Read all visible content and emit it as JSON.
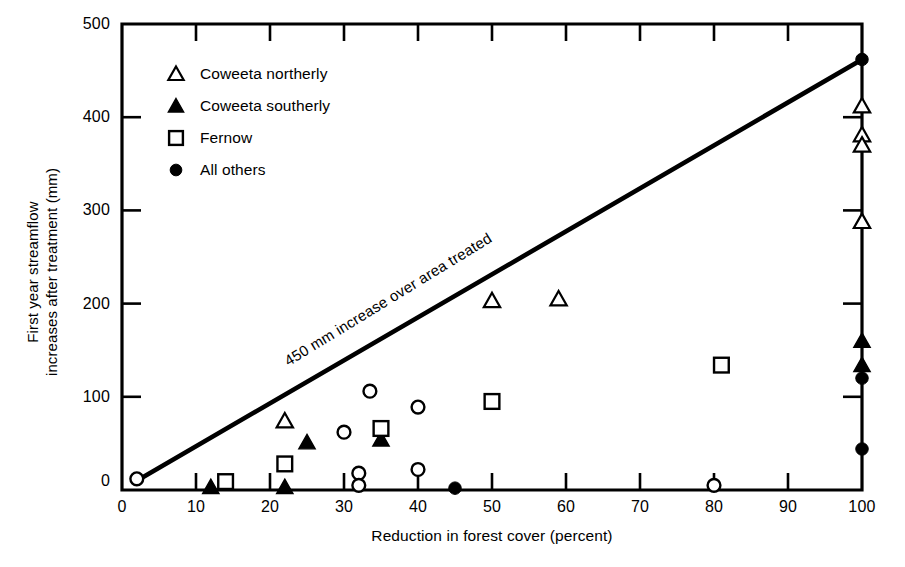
{
  "chart_data": {
    "type": "scatter",
    "title": "",
    "xlabel": "Reduction in forest cover (percent)",
    "ylabel": "First year streamflow\nincreases after treatment (mm)",
    "xlim": [
      0,
      100
    ],
    "ylim": [
      0,
      500
    ],
    "xticks": [
      0,
      10,
      20,
      30,
      40,
      50,
      60,
      70,
      80,
      90,
      100
    ],
    "yticks": [
      0,
      100,
      200,
      300,
      400,
      500
    ],
    "xtick_labels": [
      "0",
      "10",
      "20",
      "30",
      "40",
      "50",
      "60",
      "70",
      "80",
      "90",
      "100"
    ],
    "ytick_labels": [
      "0",
      "100",
      "200",
      "300",
      "400",
      "500"
    ],
    "grid": false,
    "legend_position": "upper-left-inside",
    "annotations": [
      {
        "text": "450 mm increase over area treated",
        "kind": "reference-line-label",
        "rotation_deg": -31.5
      }
    ],
    "reference_line": {
      "label": "450 mm increase over area treated",
      "x": [
        2,
        100
      ],
      "y": [
        10,
        462
      ],
      "slope_mm_per_percent": 4.6
    },
    "series": [
      {
        "name": "Coweeta northerly",
        "marker": "open-triangle",
        "points": [
          {
            "x": 22,
            "y": 74
          },
          {
            "x": 50,
            "y": 203
          },
          {
            "x": 59,
            "y": 205
          },
          {
            "x": 100,
            "y": 412
          },
          {
            "x": 100,
            "y": 381
          },
          {
            "x": 100,
            "y": 370
          },
          {
            "x": 100,
            "y": 288
          }
        ]
      },
      {
        "name": "Coweeta southerly",
        "marker": "filled-triangle",
        "points": [
          {
            "x": 12,
            "y": 3
          },
          {
            "x": 22,
            "y": 3
          },
          {
            "x": 25,
            "y": 51
          },
          {
            "x": 35,
            "y": 54
          },
          {
            "x": 100,
            "y": 160
          },
          {
            "x": 100,
            "y": 134
          }
        ]
      },
      {
        "name": "Fernow",
        "marker": "open-square",
        "points": [
          {
            "x": 14,
            "y": 9
          },
          {
            "x": 22,
            "y": 28
          },
          {
            "x": 35,
            "y": 66
          },
          {
            "x": 50,
            "y": 95
          },
          {
            "x": 81,
            "y": 134
          }
        ]
      },
      {
        "name": "All others",
        "marker": "filled-circle",
        "points": [
          {
            "x": 45,
            "y": 2
          },
          {
            "x": 100,
            "y": 462
          },
          {
            "x": 100,
            "y": 120
          },
          {
            "x": 100,
            "y": 44
          }
        ]
      },
      {
        "name": "All others (open)",
        "marker": "open-circle",
        "points": [
          {
            "x": 2,
            "y": 12
          },
          {
            "x": 30,
            "y": 62
          },
          {
            "x": 32,
            "y": 18
          },
          {
            "x": 32,
            "y": 5
          },
          {
            "x": 33.5,
            "y": 106
          },
          {
            "x": 40,
            "y": 89
          },
          {
            "x": 40,
            "y": 22
          },
          {
            "x": 80,
            "y": 5
          }
        ]
      }
    ]
  },
  "legend": {
    "items": [
      {
        "marker": "open-triangle",
        "label": "Coweeta northerly"
      },
      {
        "marker": "filled-triangle",
        "label": "Coweeta southerly"
      },
      {
        "marker": "open-square",
        "label": "Fernow"
      },
      {
        "marker": "filled-circle",
        "label": "All others"
      }
    ]
  },
  "colors": {
    "ink": "#000000",
    "background": "#ffffff"
  }
}
